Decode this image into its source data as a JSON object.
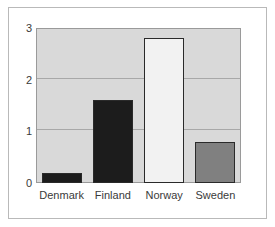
{
  "chart_data": {
    "type": "bar",
    "title": "",
    "subtitle": "",
    "xlabel": "",
    "ylabel": "",
    "categories": [
      "Denmark",
      "Finland",
      "Norway",
      "Sweden"
    ],
    "values": [
      0.2,
      1.6,
      2.8,
      0.8
    ],
    "series": [
      {
        "name": "",
        "values": [
          0.2,
          1.6,
          2.8,
          0.8
        ]
      }
    ],
    "bar_colors": [
      "#1c1c1c",
      "#1c1c1c",
      "#f2f2f2",
      "#808080"
    ],
    "bar_edge_color": "#2a2a2a",
    "ylim": [
      0,
      3
    ],
    "y_ticks": [
      "0",
      "1",
      "2",
      "3"
    ],
    "y_tick_values": [
      0,
      1,
      2,
      3
    ],
    "x_ticks": [
      "Denmark",
      "Finland",
      "Norway",
      "Sweden"
    ],
    "grid": true,
    "grid_axis": "y",
    "legend": false,
    "legend_position": "none",
    "plot_background": "#d9d9d9",
    "figure_background": "#ffffff",
    "frame_color": "#b9b9b9",
    "axis_color": "#9a9a9a",
    "gridline_color": "#a8a8a8",
    "text_color": "#3a3a3a"
  }
}
